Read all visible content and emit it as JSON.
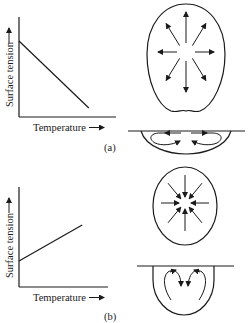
{
  "figure": {
    "panels": [
      {
        "id": "a",
        "caption": "(a)",
        "graph": {
          "ylabel": "Surface tension",
          "xlabel": "Temperature",
          "arrow_glyph": "→",
          "trend": "decreasing",
          "line": {
            "x": [
              0,
              0.72
            ],
            "y": [
              0.76,
              0.09
            ]
          }
        },
        "drop": {
          "flow": "outward",
          "arrow_count": 8
        },
        "cross_section": {
          "flow": "surface-outward, return-inward-from-below"
        }
      },
      {
        "id": "b",
        "caption": "(b)",
        "graph": {
          "ylabel": "Surface tension",
          "xlabel": "Temperature",
          "arrow_glyph": "→",
          "trend": "increasing",
          "line": {
            "x": [
              0,
              0.71
            ],
            "y": [
              0.26,
              0.62
            ]
          }
        },
        "drop": {
          "flow": "inward",
          "arrow_count": 8
        },
        "cross_section": {
          "flow": "surface-inward, downward-at-center"
        }
      }
    ]
  },
  "text": {
    "a_ylabel": "Surface tension",
    "a_xlabel": "Temperature",
    "a_caption": "(a)",
    "b_ylabel": "Surface tension",
    "b_xlabel": "Temperature",
    "b_caption": "(b)"
  },
  "colors": {
    "ink": "#1a1a1a",
    "background": "#ffffff"
  }
}
